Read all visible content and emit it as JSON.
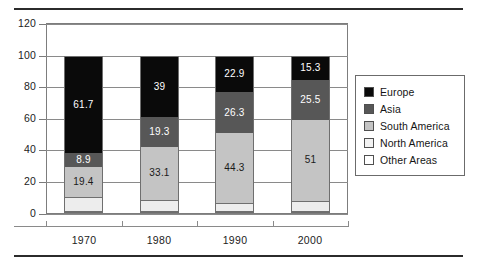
{
  "chart_data": {
    "type": "bar",
    "subtype": "stacked-bar",
    "title": "",
    "xlabel": "",
    "ylabel": "",
    "categories": [
      "1970",
      "1980",
      "1990",
      "2000"
    ],
    "ylim": [
      0,
      120
    ],
    "yticks": [
      0,
      20,
      40,
      60,
      80,
      100,
      120
    ],
    "ytick_labels": [
      "0",
      "20",
      "40",
      "60",
      "80",
      "100",
      "120"
    ],
    "grid": true,
    "legend_position": "right",
    "stack_order_bottom_to_top": [
      "Other Areas",
      "North America",
      "South America",
      "Asia",
      "Europe"
    ],
    "series": [
      {
        "name": "Europe",
        "color": "#0a0a0a",
        "values": [
          61.7,
          39,
          22.9,
          15.3
        ],
        "labels": [
          "61.7",
          "39",
          "22.9",
          "15.3"
        ]
      },
      {
        "name": "Asia",
        "color": "#575757",
        "values": [
          8.9,
          19.3,
          26.3,
          25.5
        ],
        "labels": [
          "8.9",
          "19.3",
          "26.3",
          "25.5"
        ]
      },
      {
        "name": "South America",
        "color": "#c4c4c4",
        "values": [
          19.4,
          33.1,
          44.3,
          51
        ],
        "labels": [
          "19.4",
          "33.1",
          "44.3",
          "51"
        ]
      },
      {
        "name": "North America",
        "color": "#ededed",
        "values": [
          9,
          7.6,
          5,
          6.7
        ],
        "labels": [
          "",
          "",
          "",
          ""
        ]
      },
      {
        "name": "Other Areas",
        "color": "#ffffff",
        "values": [
          1,
          1,
          1.5,
          1.5
        ],
        "labels": [
          "",
          "",
          "",
          ""
        ]
      }
    ],
    "bars": [
      {
        "category": "1970",
        "total": 100,
        "segments": [
          {
            "name": "Europe",
            "value": 61.7,
            "label": "61.7",
            "cls": "europe"
          },
          {
            "name": "Asia",
            "value": 8.9,
            "label": "8.9",
            "cls": "asia"
          },
          {
            "name": "South America",
            "value": 19.4,
            "label": "19.4",
            "cls": "south"
          },
          {
            "name": "North America",
            "value": 9,
            "label": "",
            "cls": "north"
          },
          {
            "name": "Other Areas",
            "value": 1,
            "label": "",
            "cls": "other"
          }
        ]
      },
      {
        "category": "1980",
        "total": 100,
        "segments": [
          {
            "name": "Europe",
            "value": 39,
            "label": "39",
            "cls": "europe"
          },
          {
            "name": "Asia",
            "value": 19.3,
            "label": "19.3",
            "cls": "asia"
          },
          {
            "name": "South America",
            "value": 33.1,
            "label": "33.1",
            "cls": "south"
          },
          {
            "name": "North America",
            "value": 7.6,
            "label": "",
            "cls": "north"
          },
          {
            "name": "Other Areas",
            "value": 1,
            "label": "",
            "cls": "other"
          }
        ]
      },
      {
        "category": "1990",
        "total": 100,
        "segments": [
          {
            "name": "Europe",
            "value": 22.9,
            "label": "22.9",
            "cls": "europe"
          },
          {
            "name": "Asia",
            "value": 26.3,
            "label": "26.3",
            "cls": "asia"
          },
          {
            "name": "South America",
            "value": 44.3,
            "label": "44.3",
            "cls": "south"
          },
          {
            "name": "North America",
            "value": 5,
            "label": "",
            "cls": "north"
          },
          {
            "name": "Other Areas",
            "value": 1.5,
            "label": "",
            "cls": "other"
          }
        ]
      },
      {
        "category": "2000",
        "total": 100,
        "segments": [
          {
            "name": "Europe",
            "value": 15.3,
            "label": "15.3",
            "cls": "europe"
          },
          {
            "name": "Asia",
            "value": 25.5,
            "label": "25.5",
            "cls": "asia"
          },
          {
            "name": "South America",
            "value": 51,
            "label": "51",
            "cls": "south"
          },
          {
            "name": "North America",
            "value": 6.7,
            "label": "",
            "cls": "north"
          },
          {
            "name": "Other Areas",
            "value": 1.5,
            "label": "",
            "cls": "other"
          }
        ]
      }
    ],
    "legend": [
      {
        "label": "Europe",
        "color": "#0a0a0a",
        "cls": "europe"
      },
      {
        "label": "Asia",
        "color": "#575757",
        "cls": "asia"
      },
      {
        "label": "South America",
        "color": "#c4c4c4",
        "cls": "south"
      },
      {
        "label": "North America",
        "color": "#f2f2f2",
        "cls": "north"
      },
      {
        "label": "Other Areas",
        "color": "#ffffff",
        "cls": "other"
      }
    ]
  }
}
